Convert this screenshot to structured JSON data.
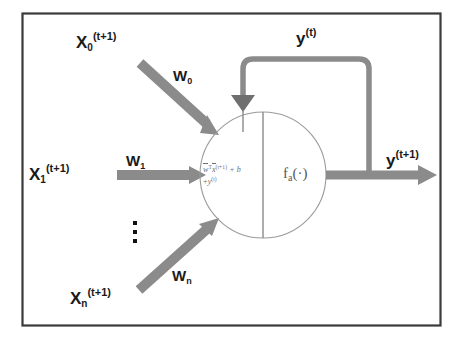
{
  "figure": {
    "kind": "recurrent-neuron-diagram",
    "frame": {
      "border_color": "#3a3a3a"
    },
    "background_color": "#ffffff",
    "arrow_color": "#8b8b8b",
    "loop_color": "#8b8b8b",
    "circle_outline_color": "#9a9a9a",
    "text_color": "#1a1a1a",
    "formula_color": "#6d6d6d"
  },
  "inputs": [
    {
      "id": "x0",
      "base": "X",
      "subscript": "0",
      "superscript": "(t+1)",
      "weight_base": "W",
      "weight_subscript": "0"
    },
    {
      "id": "x1",
      "base": "X",
      "subscript": "1",
      "superscript": "(t+1)",
      "weight_base": "W",
      "weight_subscript": "1"
    },
    {
      "id": "xn",
      "base": "X",
      "subscript": "n",
      "superscript": "(t+1)",
      "weight_base": "W",
      "weight_subscript": "n"
    }
  ],
  "ellipsis": "⋮",
  "neuron": {
    "left_half": {
      "line1": {
        "w": "w",
        "wT": "T",
        "x": "x",
        "x_sup": "(t+1)",
        "plus_b": "+ b"
      },
      "line2": {
        "plus": "+",
        "y": "y",
        "y_sup": "(t)"
      },
      "plain_text": "w̄ᵀx̄⁽ᵗ⁺¹⁾ + b + y⁽ᵗ⁾"
    },
    "right_half": {
      "f": "f",
      "subscript": "a",
      "arg": "(·)",
      "plain_text": "f_a(·)"
    }
  },
  "outputs": {
    "feedback": {
      "base": "y",
      "superscript": "(t)"
    },
    "forward": {
      "base": "y",
      "superscript": "(t+1)"
    }
  }
}
